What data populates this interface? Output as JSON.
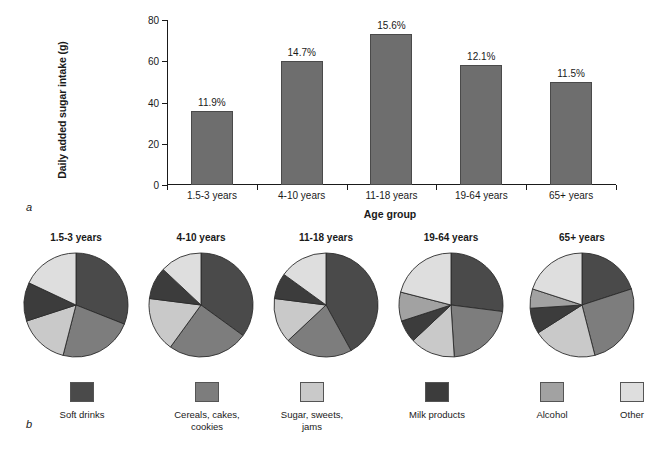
{
  "figure": {
    "panel_a_letter": "a",
    "panel_b_letter": "b"
  },
  "chart_data": [
    {
      "type": "bar",
      "panel": "a",
      "title": "",
      "xlabel": "Age group",
      "ylabel": "Daily added sugar intake (g)",
      "ylim": [
        0,
        80
      ],
      "yticks": [
        0,
        20,
        40,
        60,
        80
      ],
      "grid": false,
      "legend": "none",
      "categories": [
        "1.5-3 years",
        "4-10 years",
        "11-18 years",
        "19-64 years",
        "65+ years"
      ],
      "values": [
        36,
        60,
        73,
        58,
        50
      ],
      "data_labels": [
        "11.9%",
        "14.7%",
        "15.6%",
        "12.1%",
        "11.5%"
      ],
      "bar_color": "#6e6e6e"
    },
    {
      "type": "pie",
      "panel": "b",
      "title": "",
      "legend_position": "bottom",
      "slice_labels": [
        "Soft drinks",
        "Cereals, cakes,\ncookies",
        "Sugar, sweets,\njams",
        "Milk products",
        "Alcohol",
        "Other"
      ],
      "slice_colors": [
        "#4a4a4a",
        "#7d7d7d",
        "#c9c9c9",
        "#3c3c3c",
        "#a2a2a2",
        "#dedede"
      ],
      "pies": [
        {
          "title": "1.5-3 years",
          "values": [
            31,
            23,
            16,
            12,
            0,
            18
          ]
        },
        {
          "title": "4-10 years",
          "values": [
            35,
            25,
            17,
            10,
            0,
            13
          ]
        },
        {
          "title": "11-18 years",
          "values": [
            42,
            21,
            14,
            8,
            0,
            15
          ]
        },
        {
          "title": "19-64 years",
          "values": [
            27,
            22,
            14,
            7,
            9,
            21
          ]
        },
        {
          "title": "65+ years",
          "values": [
            20,
            26,
            20,
            8,
            6,
            20
          ]
        }
      ]
    }
  ]
}
